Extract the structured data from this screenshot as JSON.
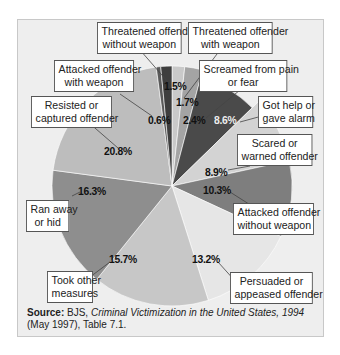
{
  "chart_data": {
    "type": "pie",
    "title": "",
    "slices": [
      {
        "label": "Threatened offender with weapon",
        "value": 1.7,
        "color": "#c9c9c9"
      },
      {
        "label": "Screamed from pain or fear",
        "value": 2.4,
        "color": "#a4a4a4"
      },
      {
        "label": "Got help or gave alarm",
        "value": 8.6,
        "color": "#4a4a4a",
        "exploded": true
      },
      {
        "label": "Scared or warned offender",
        "value": 8.9,
        "color": "#d3d3d3"
      },
      {
        "label": "Attacked offender without weapon",
        "value": 10.3,
        "color": "#7e7e7e"
      },
      {
        "label": "Persuaded or appeased offender",
        "value": 13.2,
        "color": "#e6e6e6"
      },
      {
        "label": "Took other measures",
        "value": 15.7,
        "color": "#c7c7c7"
      },
      {
        "label": "Ran away or hid",
        "value": 16.3,
        "color": "#8e8e8e"
      },
      {
        "label": "Resisted or captured offender",
        "value": 20.8,
        "color": "#bdbdbd"
      },
      {
        "label": "Attacked offender with weapon",
        "value": 0.6,
        "color": "#5a5a5a"
      },
      {
        "label": "Threatened offender without weapon",
        "value": 1.5,
        "color": "#3e3e3e"
      }
    ],
    "unit": "%",
    "start_angle_deg": 0,
    "direction": "clockwise"
  },
  "labels": {
    "threatened_without_weapon": [
      "Threatened offender",
      "without weapon"
    ],
    "threatened_with_weapon": [
      "Threatened offender",
      "with weapon"
    ],
    "attacked_with_weapon": [
      "Attacked offender",
      "with weapon"
    ],
    "screamed": [
      "Screamed from pain",
      "or fear"
    ],
    "resisted": [
      "Resisted or",
      "captured offender"
    ],
    "got_help": [
      "Got help or",
      "gave alarm"
    ],
    "scared": [
      "Scared or",
      "warned offender"
    ],
    "attacked_without_weapon": [
      "Attacked offender",
      "without weapon"
    ],
    "ran_away": [
      "Ran away",
      "or hid"
    ],
    "took_other": [
      "Took other",
      "measures"
    ],
    "persuaded": [
      "Persuaded or",
      "appeased offender"
    ]
  },
  "percentages": {
    "p1_5": "1.5%",
    "p1_7": "1.7%",
    "p0_6": "0.6%",
    "p2_4": "2.4%",
    "p8_6": "8.6%",
    "p20_8": "20.8%",
    "p8_9": "8.9%",
    "p10_3": "10.3%",
    "p16_3": "16.3%",
    "p15_7": "15.7%",
    "p13_2": "13.2%"
  },
  "source": {
    "label": "Source:",
    "org": " BJS, ",
    "title": "Criminal Victimization in the United States, 1994",
    "rest": " (May 1997), Table 7.1."
  }
}
